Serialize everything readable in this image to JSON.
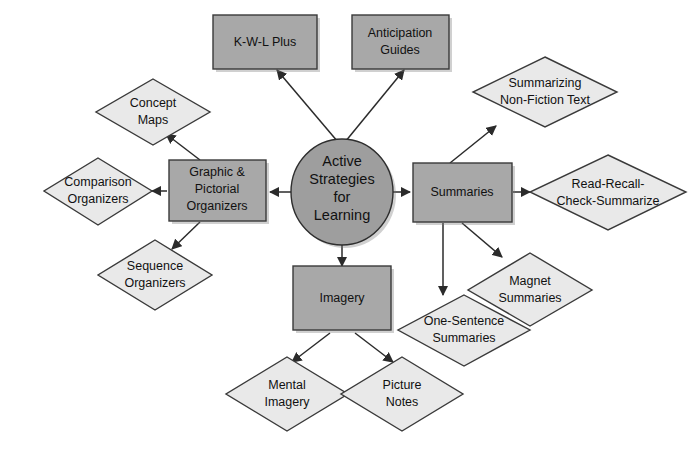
{
  "diagram": {
    "title": "Active Strategies for Learning",
    "background_color": "#ffffff",
    "colors": {
      "box_fill": "#a8a8a8",
      "diamond_fill": "#e9e9e9",
      "ellipse_fill": "#9e9e9e",
      "stroke": "#3a3a3a",
      "text": "#111111"
    },
    "center": {
      "shape": "ellipse",
      "lines": [
        "Active",
        "Strategies",
        "for",
        "Learning"
      ]
    },
    "nodes": [
      {
        "id": "kwl",
        "shape": "box",
        "lines": [
          "K-W-L Plus"
        ]
      },
      {
        "id": "anticipation",
        "shape": "box",
        "lines": [
          "Anticipation",
          "Guides"
        ]
      },
      {
        "id": "graphic",
        "shape": "box",
        "lines": [
          "Graphic &",
          "Pictorial",
          "Organizers"
        ]
      },
      {
        "id": "summaries",
        "shape": "box",
        "lines": [
          "Summaries"
        ]
      },
      {
        "id": "imagery",
        "shape": "box",
        "lines": [
          "Imagery"
        ]
      },
      {
        "id": "concept-maps",
        "shape": "diamond",
        "lines": [
          "Concept",
          "Maps"
        ]
      },
      {
        "id": "comparison",
        "shape": "diamond",
        "lines": [
          "Comparison",
          "Organizers"
        ]
      },
      {
        "id": "sequence",
        "shape": "diamond",
        "lines": [
          "Sequence",
          "Organizers"
        ]
      },
      {
        "id": "summarizing-nonfiction",
        "shape": "diamond",
        "lines": [
          "Summarizing",
          "Non-Fiction Text"
        ]
      },
      {
        "id": "read-recall",
        "shape": "diamond",
        "lines": [
          "Read-Recall-",
          "Check-Summarize"
        ]
      },
      {
        "id": "magnet",
        "shape": "diamond",
        "lines": [
          "Magnet",
          "Summaries"
        ]
      },
      {
        "id": "one-sentence",
        "shape": "diamond",
        "lines": [
          "One-Sentence",
          "Summaries"
        ]
      },
      {
        "id": "mental-imagery",
        "shape": "diamond",
        "lines": [
          "Mental",
          "Imagery"
        ]
      },
      {
        "id": "picture-notes",
        "shape": "diamond",
        "lines": [
          "Picture",
          "Notes"
        ]
      }
    ],
    "edges": [
      {
        "from": "center",
        "to": "kwl"
      },
      {
        "from": "center",
        "to": "anticipation"
      },
      {
        "from": "center",
        "to": "graphic"
      },
      {
        "from": "center",
        "to": "summaries"
      },
      {
        "from": "center",
        "to": "imagery"
      },
      {
        "from": "graphic",
        "to": "concept-maps"
      },
      {
        "from": "graphic",
        "to": "comparison"
      },
      {
        "from": "graphic",
        "to": "sequence"
      },
      {
        "from": "summaries",
        "to": "summarizing-nonfiction"
      },
      {
        "from": "summaries",
        "to": "read-recall"
      },
      {
        "from": "summaries",
        "to": "magnet"
      },
      {
        "from": "summaries",
        "to": "one-sentence"
      },
      {
        "from": "imagery",
        "to": "mental-imagery"
      },
      {
        "from": "imagery",
        "to": "picture-notes"
      }
    ]
  }
}
